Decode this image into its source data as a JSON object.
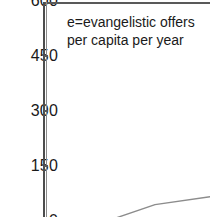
{
  "annotation": {
    "line1": "e=evangelistic offers",
    "line2": "per capita per year"
  },
  "axis": {
    "tick_600": "600",
    "tick_450": "450",
    "tick_300": "300",
    "tick_150": "150",
    "tick_0": "0"
  },
  "colors": {
    "axis": "#4d4d4d",
    "series": "#8c8c8c",
    "text": "#1a1a1a",
    "background": "#ffffff"
  },
  "chart_data": {
    "type": "line",
    "title": "",
    "subtitle": "",
    "xlabel": "",
    "ylabel": "",
    "annotations": [
      "e=evangelistic offers",
      "per capita per year"
    ],
    "ytick_labels": [
      "600",
      "450",
      "300",
      "150",
      "0"
    ],
    "ytick_values": [
      600,
      450,
      300,
      150,
      0
    ],
    "ylim": [
      0,
      600
    ],
    "xtick_labels": [],
    "grid": false,
    "legend": false,
    "note": "Cropped view: only the upper-left region of a larger line chart is visible. The 600 label is clipped at the top edge and the 0 label at the bottom edge. The x axis and its tick labels fall outside the crop.",
    "series": [
      {
        "name": "e",
        "x_pixels": [
          110,
          155,
          210
        ],
        "y_values": [
          0,
          42,
          63
        ],
        "comment": "Values read against the y axis: the polyline enters the bottom edge near 0, bends at roughly 42, and exits the right edge near 63."
      }
    ]
  }
}
